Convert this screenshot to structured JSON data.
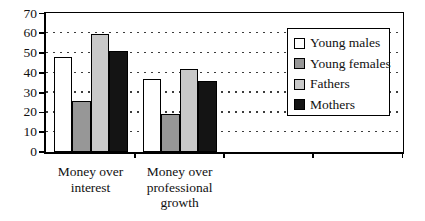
{
  "figure": {
    "background_color": "#ffffff",
    "frame_color": "#000000"
  },
  "chart_data": {
    "type": "bar",
    "title": "",
    "xlabel": "",
    "ylabel": "",
    "categories": [
      "Money over interest",
      "Money over professional growth"
    ],
    "category_label_lines": [
      [
        "Money over",
        "interest"
      ],
      [
        "Money over",
        "professional",
        "growth"
      ]
    ],
    "series": [
      {
        "name": "Young males",
        "color": "#ffffff",
        "values": [
          48,
          37
        ]
      },
      {
        "name": "Young females",
        "color": "#979797",
        "values": [
          26,
          19
        ]
      },
      {
        "name": "Fathers",
        "color": "#c9c9c9",
        "values": [
          59.5,
          42
        ]
      },
      {
        "name": "Mothers",
        "color": "#141414",
        "values": [
          51,
          36
        ]
      }
    ],
    "ylim": [
      0,
      70
    ],
    "yticks": [
      0,
      10,
      20,
      30,
      40,
      50,
      60,
      70
    ],
    "grid": "horizontal dashed lines at 10..60",
    "gridline_color": "#3c3c3c",
    "bar_outline_color": "#000000",
    "legend_position": "right overlay inside plot",
    "num_category_slots": 4
  }
}
